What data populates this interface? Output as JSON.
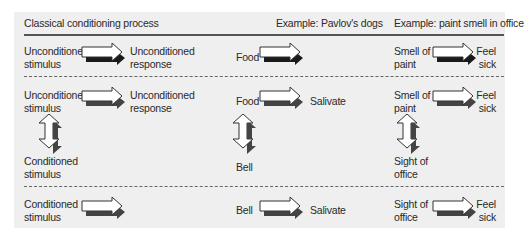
{
  "headers": {
    "process": "Classical conditioning process",
    "pavlov": "Example:  Pavlov's dogs",
    "paint": "Example: paint smell in office"
  },
  "rows": [
    {
      "name": "before-conditioning",
      "process": {
        "from_line1": "Unconditioned",
        "from_line2": "stimulus",
        "to_line1": "Unconditioned",
        "to_line2": "response"
      },
      "pavlov": {
        "from": "Food",
        "to": ""
      },
      "paint": {
        "from_line1": "Smell of",
        "from_line2": "paint",
        "to_line1": "Feel",
        "to_line2": "sick"
      }
    },
    {
      "name": "during-conditioning",
      "process": {
        "from_line1": "Unconditioned",
        "from_line2": "stimulus",
        "to_line1": "Unconditioned",
        "to_line2": "response",
        "paired_line1": "Conditioned",
        "paired_line2": "stimulus"
      },
      "pavlov": {
        "from": "Food",
        "to": "Salivate",
        "paired": "Bell"
      },
      "paint": {
        "from_line1": "Smell of",
        "from_line2": "paint",
        "to_line1": "Feel",
        "to_line2": "sick",
        "paired_line1": "Sight of",
        "paired_line2": "office"
      }
    },
    {
      "name": "after-conditioning",
      "process": {
        "from_line1": "Conditioned",
        "from_line2": "stimulus",
        "to_line1": "",
        "to_line2": ""
      },
      "pavlov": {
        "from": "Bell",
        "to": "Salivate"
      },
      "paint": {
        "from_line1": "Sight of",
        "from_line2": "office",
        "to_line1": "Feel",
        "to_line2": "sick"
      }
    }
  ],
  "icons": {
    "right_arrow": "right-arrow-icon",
    "double_vertical_arrow": "up-down-arrow-icon"
  },
  "colors": {
    "panel_bg": "#efefef",
    "arrow_fill": "#ffffff",
    "arrow_shadow_row1": "#1a1a1a",
    "arrow_shadow": "#444444",
    "divider": "#555555"
  }
}
